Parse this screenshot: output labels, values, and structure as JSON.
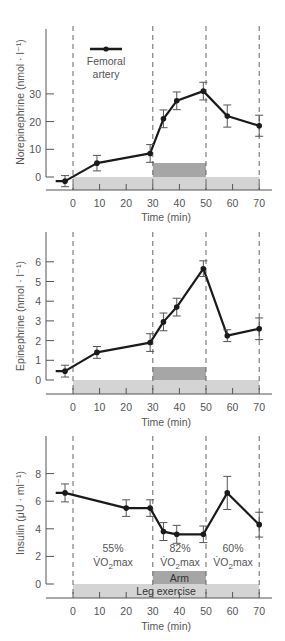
{
  "figure": {
    "x_label": "Time (min)",
    "x_ticks": [
      0,
      10,
      20,
      30,
      40,
      50,
      60,
      70
    ],
    "phase_markers_min": [
      0,
      30,
      50,
      70
    ],
    "colors": {
      "line": "#1a1a1a",
      "axis": "#555555",
      "leg_bar": "#d4d4d4",
      "arm_bar": "#a6a6a6",
      "dashed": "#666666",
      "text": "#555555"
    }
  },
  "chart_data": [
    {
      "type": "line",
      "title": "",
      "xlabel": "Time (min)",
      "ylabel": "Norepinephrine (nmol · l⁻¹)",
      "xlim": [
        -8,
        72
      ],
      "ylim": [
        -2,
        45
      ],
      "yticks": [
        0,
        10,
        20,
        30
      ],
      "xticks": [
        0,
        10,
        20,
        30,
        40,
        50,
        60,
        70
      ],
      "grid": false,
      "legend": {
        "position": "upper-left",
        "entries": [
          "Femoral",
          "artery"
        ]
      },
      "series": [
        {
          "name": "Femoral artery",
          "start_x": -6.5,
          "x": [
            -3,
            9,
            29,
            34,
            39,
            49,
            58,
            70
          ],
          "y": [
            -1.5,
            5,
            8.5,
            21,
            27.5,
            31,
            22,
            18.5
          ],
          "err": [
            2,
            2.8,
            3.2,
            3.2,
            3.2,
            3.2,
            4,
            3.8
          ]
        }
      ],
      "bars": {
        "leg": [
          0,
          70
        ],
        "arm": [
          30,
          50
        ]
      }
    },
    {
      "type": "line",
      "title": "",
      "xlabel": "Time (min)",
      "ylabel": "Epinephrine (nmol · l⁻¹)",
      "xlim": [
        -8,
        72
      ],
      "ylim": [
        -0.7,
        7.5
      ],
      "yticks": [
        0,
        1,
        2,
        3,
        4,
        5,
        6
      ],
      "xticks": [
        0,
        10,
        20,
        30,
        40,
        50,
        60,
        70
      ],
      "grid": false,
      "series": [
        {
          "name": "Femoral artery",
          "start_x": -6.5,
          "x": [
            -3,
            9,
            29,
            34,
            39,
            49,
            58,
            70
          ],
          "y": [
            0.45,
            1.4,
            1.9,
            2.95,
            3.7,
            5.65,
            2.25,
            2.6
          ],
          "err": [
            0.3,
            0.3,
            0.45,
            0.45,
            0.45,
            0.4,
            0.3,
            0.55
          ]
        }
      ],
      "bars": {
        "leg": [
          0,
          70
        ],
        "arm": [
          30,
          50
        ]
      }
    },
    {
      "type": "line",
      "title": "",
      "xlabel": "Time (min)",
      "ylabel": "Insulin (μU · ml⁻¹)",
      "xlim": [
        -8,
        72
      ],
      "ylim": [
        -1,
        11
      ],
      "yticks": [
        0,
        2,
        4,
        6,
        8
      ],
      "xticks": [
        0,
        10,
        20,
        30,
        40,
        50,
        60,
        70
      ],
      "grid": false,
      "series": [
        {
          "name": "Femoral artery",
          "start_x": -6.5,
          "x": [
            -3,
            20,
            29,
            34,
            39,
            49,
            58,
            70
          ],
          "y": [
            6.6,
            5.5,
            5.5,
            3.8,
            3.6,
            3.6,
            6.6,
            4.3
          ],
          "err": [
            0.65,
            0.6,
            0.6,
            0.65,
            0.65,
            0.6,
            1.2,
            0.9
          ]
        }
      ],
      "bars": {
        "leg": [
          0,
          70
        ],
        "arm": [
          30,
          50
        ]
      },
      "annotations": [
        {
          "pct": "55%",
          "label": "VO2max",
          "x_center": 15
        },
        {
          "pct": "82%",
          "label": "VO2max",
          "x_center": 40
        },
        {
          "pct": "60%",
          "label": "VO2max",
          "x_center": 60
        }
      ],
      "bar_labels": {
        "arm": "Arm",
        "leg": "Leg exercise"
      }
    }
  ],
  "panels": {
    "norepinephrine": {
      "ylabel": "Norepinephrine (nmol · l⁻¹)",
      "legend_line1": "Femoral",
      "legend_line2": "artery"
    },
    "epinephrine": {
      "ylabel": "Epinephrine (nmol · l⁻¹)"
    },
    "insulin": {
      "ylabel": "Insulin (μU · ml⁻¹)",
      "phase_1_pct": "55%",
      "phase_2_pct": "82%",
      "phase_3_pct": "60%",
      "vo2_text": "V̇O",
      "vo2_sub": "2",
      "vo2_suffix": "max",
      "arm_label": "Arm",
      "leg_label": "Leg exercise"
    }
  }
}
